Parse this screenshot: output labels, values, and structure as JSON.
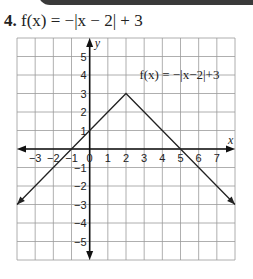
{
  "problem": {
    "number": "4.",
    "equation": "f(x) = −|x − 2| + 3"
  },
  "chart_data": {
    "type": "line",
    "title": "f(x) = −|x − 2| + 3",
    "xlabel": "x",
    "ylabel": "y",
    "xlim": [
      -4,
      8
    ],
    "ylim": [
      -6,
      6
    ],
    "grid": true,
    "x_ticks": [
      "−3",
      "−2",
      "−1",
      "0",
      "1",
      "2",
      "3",
      "4",
      "5",
      "6",
      "7"
    ],
    "y_ticks": [
      "5",
      "4",
      "3",
      "2",
      "1",
      "−1",
      "−2",
      "−3",
      "−4",
      "−5"
    ],
    "series": [
      {
        "name": "f(x) = −|x−2|+3",
        "x": [
          -4,
          2,
          8
        ],
        "y": [
          -3,
          3,
          -3
        ],
        "arrows_at_ends": true
      }
    ],
    "key_points": {
      "vertex": [
        2,
        3
      ],
      "x_intercepts": [
        [
          -1,
          0
        ],
        [
          5,
          0
        ]
      ],
      "y_intercept": [
        0,
        1
      ]
    },
    "annotation": {
      "text": "f(x) = −|x−2|+3",
      "position": [
        2.3,
        4
      ]
    }
  }
}
